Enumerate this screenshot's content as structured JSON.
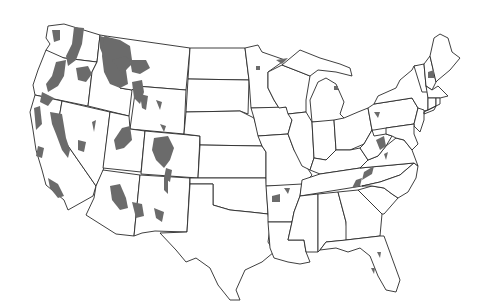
{
  "map": {
    "title": "",
    "region": "Contiguous United States",
    "style": {
      "background": "#ffffff",
      "border_color": "#2a2a2a",
      "shade_color": "#6b6b6b"
    },
    "legend": null,
    "shaded_regions_description": "Gray shaded areas concentrated in western mountain regions (Cascades, Sierra Nevada, Northern Rockies, Colorado Rockies, Arizona/New Mexico highlands) with scattered small patches in Arkansas, the Appalachians, Minnesota, Michigan, New Hampshire, Pennsylvania and Florida",
    "states": [
      "WA",
      "OR",
      "CA",
      "ID",
      "NV",
      "MT",
      "WY",
      "UT",
      "AZ",
      "CO",
      "NM",
      "ND",
      "SD",
      "NE",
      "KS",
      "OK",
      "TX",
      "MN",
      "IA",
      "MO",
      "AR",
      "LA",
      "WI",
      "IL",
      "MI",
      "IN",
      "OH",
      "KY",
      "TN",
      "MS",
      "AL",
      "GA",
      "FL",
      "SC",
      "NC",
      "VA",
      "WV",
      "PA",
      "NY",
      "VT",
      "NH",
      "ME",
      "MA",
      "CT",
      "RI",
      "NJ",
      "DE",
      "MD"
    ]
  }
}
